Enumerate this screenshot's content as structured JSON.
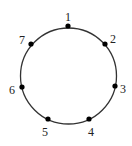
{
  "diagram": {
    "type": "circle-with-points",
    "circle": {
      "cx": 68.5,
      "cy": 76,
      "r": 48,
      "stroke": "#333333"
    },
    "points": [
      {
        "label": "1",
        "x": 68,
        "y": 26,
        "lx": 68,
        "ly": 18
      },
      {
        "label": "2",
        "x": 105,
        "y": 44,
        "lx": 113,
        "ly": 40
      },
      {
        "label": "3",
        "x": 115,
        "y": 86,
        "lx": 123,
        "ly": 90
      },
      {
        "label": "4",
        "x": 89,
        "y": 119,
        "lx": 91,
        "ly": 133
      },
      {
        "label": "5",
        "x": 48,
        "y": 119,
        "lx": 45,
        "ly": 133
      },
      {
        "label": "6",
        "x": 22,
        "y": 87,
        "lx": 12,
        "ly": 91
      },
      {
        "label": "7",
        "x": 31,
        "y": 44,
        "lx": 22,
        "ly": 41
      }
    ],
    "point_color": "#000000"
  }
}
